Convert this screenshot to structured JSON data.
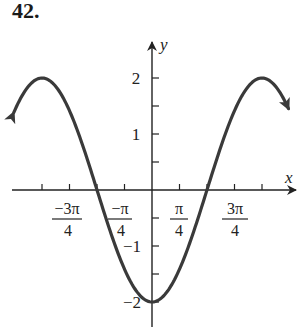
{
  "problem_number": "42.",
  "chart_data": {
    "type": "line",
    "title": "",
    "function": "y = -2cos(x)",
    "xlabel": "x",
    "ylabel": "y",
    "x_ticks": [
      {
        "value": -3.1416,
        "label": ""
      },
      {
        "value": -2.3562,
        "label": "-3π/4"
      },
      {
        "value": -1.5708,
        "label": ""
      },
      {
        "value": -0.7854,
        "label": "-π/4"
      },
      {
        "value": 0.7854,
        "label": "π/4"
      },
      {
        "value": 1.5708,
        "label": ""
      },
      {
        "value": 2.3562,
        "label": "3π/4"
      },
      {
        "value": 3.1416,
        "label": ""
      }
    ],
    "y_ticks": [
      {
        "value": 2,
        "label": "2"
      },
      {
        "value": 1.5,
        "label": ""
      },
      {
        "value": 1,
        "label": "1"
      },
      {
        "value": 0.5,
        "label": ""
      },
      {
        "value": -0.5,
        "label": ""
      },
      {
        "value": -1,
        "label": "-1"
      },
      {
        "value": -1.5,
        "label": ""
      },
      {
        "value": -2,
        "label": "-2"
      }
    ],
    "xlim": [
      -4.3,
      4.2
    ],
    "ylim": [
      -2.4,
      2.7
    ],
    "key_points": [
      {
        "x": -3.1416,
        "y": 2
      },
      {
        "x": -1.5708,
        "y": 0
      },
      {
        "x": 0,
        "y": -2
      },
      {
        "x": 1.5708,
        "y": 0
      },
      {
        "x": 3.1416,
        "y": 2
      }
    ],
    "curve_ends_with_arrows": true,
    "grid": false
  },
  "labels": {
    "x_axis": "x",
    "y_axis": "y",
    "y2": "2",
    "y1": "1",
    "yneg1": "−1",
    "yneg2": "−2",
    "x_m3pi4_num": "−3π",
    "x_mpi4_num": "−π",
    "x_pi4_num": "π",
    "x_3pi4_num": "3π",
    "den": "4"
  }
}
